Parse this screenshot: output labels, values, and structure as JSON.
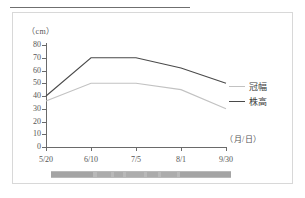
{
  "figure": {
    "caption_bar_text": ""
  },
  "chart_data": {
    "type": "line",
    "title": "",
    "xlabel": "（月/日）",
    "ylabel": "（cm）",
    "x": [
      "5/20",
      "6/10",
      "7/5",
      "8/1",
      "9/30"
    ],
    "categories": [
      "5/20",
      "6/10",
      "7/5",
      "8/1",
      "9/30"
    ],
    "ylim": [
      0,
      80
    ],
    "yticks": [
      0,
      10,
      20,
      30,
      40,
      50,
      60,
      70,
      80
    ],
    "ytick_labels": [
      "0",
      "10",
      "20",
      "30",
      "40",
      "50",
      "60",
      "70",
      "80"
    ],
    "grid": false,
    "legend_position": "right",
    "series": [
      {
        "name": "株高",
        "color": "#4a4a4a",
        "values": [
          40,
          70,
          70,
          62,
          50
        ]
      },
      {
        "name": "冠幅",
        "color": "#c2c2c2",
        "values": [
          36,
          50,
          50,
          45,
          30
        ]
      }
    ]
  }
}
